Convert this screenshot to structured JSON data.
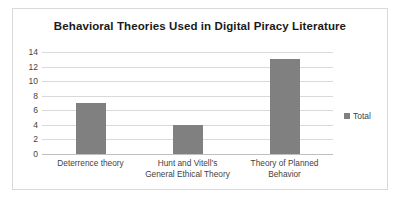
{
  "chart_data": {
    "type": "bar",
    "title": "Behavioral Theories Used in Digital Piracy Literature",
    "xlabel": "",
    "ylabel": "",
    "categories": [
      "Deterrence theory",
      "Hunt and Vitell’s General Ethical Theory",
      "Theory of Planned Behavior"
    ],
    "category_lines": [
      [
        "Deterrence theory"
      ],
      [
        "Hunt and Vitell’s",
        "General Ethical Theory"
      ],
      [
        "Theory of Planned",
        "Behavior"
      ]
    ],
    "series": [
      {
        "name": "Total",
        "values": [
          7,
          4,
          13
        ],
        "color": "#808080"
      }
    ],
    "ylim": [
      0,
      14
    ],
    "ytick_values": [
      14,
      12,
      10,
      8,
      6,
      4,
      2,
      0
    ],
    "ytick_labels": [
      "14",
      "12",
      "10",
      "8",
      "6",
      "4",
      "2",
      "0"
    ],
    "grid": true,
    "legend_position": "right",
    "legend_entries": [
      "Total"
    ],
    "colors": {
      "bar": "#808080",
      "gridline": "#d9d9d9",
      "border": "#d9d9d9",
      "title_text": "#1a1a1a",
      "tick_text": "#3f3f3f",
      "background": "#ffffff"
    }
  }
}
